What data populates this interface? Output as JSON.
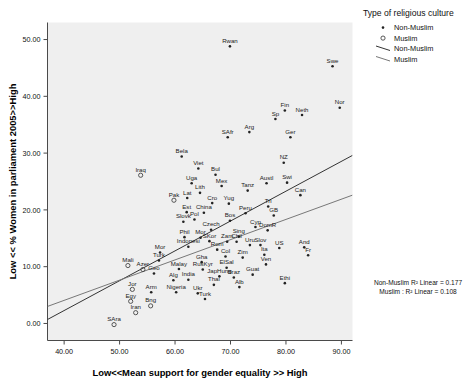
{
  "chart_data": {
    "type": "scatter",
    "title": "",
    "xlabel": "Low<<Mean support for gender equality >> High",
    "ylabel": "Low << % Women in parliament 2005>>High",
    "xlim": [
      37,
      92
    ],
    "ylim": [
      -3,
      53
    ],
    "xticks": [
      "40.00",
      "50.00",
      "60.00",
      "70.00",
      "80.00",
      "90.00"
    ],
    "xtick_values": [
      40,
      50,
      60,
      70,
      80,
      90
    ],
    "yticks": [
      "0.00",
      "10.00",
      "20.00",
      "30.00",
      "40.00",
      "50.00"
    ],
    "ytick_values": [
      0,
      10,
      20,
      30,
      40,
      50
    ],
    "grid": false,
    "legend_position": "right-top",
    "legend": {
      "title": "Type of religious culture",
      "entries": [
        {
          "label": "Non-Muslim",
          "marker": "filled-dot"
        },
        {
          "label": "Muslim",
          "marker": "open-circle"
        },
        {
          "label": "Non-Muslim",
          "marker": "line"
        },
        {
          "label": "Muslim",
          "marker": "line"
        }
      ]
    },
    "annotations": [
      "Non-Muslim R² Linear = 0.177",
      "Muslim : R² Linear = 0.108"
    ],
    "fit_lines": [
      {
        "name": "Non-Muslim",
        "x": [
          37.0,
          92.0
        ],
        "y": [
          0.7,
          29.6
        ],
        "color": "#333333"
      },
      {
        "name": "Muslim",
        "x": [
          37.0,
          92.0
        ],
        "y": [
          3.0,
          22.6
        ],
        "color": "#777777"
      }
    ],
    "series": [
      {
        "name": "Non-Muslim",
        "marker": "filled-dot",
        "points": [
          {
            "label": "Rwan",
            "x": 69.9,
            "y": 48.8
          },
          {
            "label": "Swe",
            "x": 88.4,
            "y": 45.3
          },
          {
            "label": "Nor",
            "x": 89.7,
            "y": 38.0
          },
          {
            "label": "Fin",
            "x": 79.8,
            "y": 37.5
          },
          {
            "label": "Neth",
            "x": 82.9,
            "y": 36.7
          },
          {
            "label": "Sp",
            "x": 78.1,
            "y": 36.0
          },
          {
            "label": "Ger",
            "x": 80.8,
            "y": 32.8
          },
          {
            "label": "Arg",
            "x": 73.4,
            "y": 33.7
          },
          {
            "label": "SAfr",
            "x": 69.5,
            "y": 32.8
          },
          {
            "label": "Bela",
            "x": 61.2,
            "y": 29.4
          },
          {
            "label": "NZ",
            "x": 79.6,
            "y": 28.3
          },
          {
            "label": "Viet",
            "x": 64.2,
            "y": 27.3
          },
          {
            "label": "Bul",
            "x": 67.3,
            "y": 26.2
          },
          {
            "label": "Austl",
            "x": 76.5,
            "y": 24.7
          },
          {
            "label": "Swi",
            "x": 80.2,
            "y": 24.8
          },
          {
            "label": "Uga",
            "x": 63.0,
            "y": 24.7
          },
          {
            "label": "Mex",
            "x": 68.4,
            "y": 24.2
          },
          {
            "label": "Tanz",
            "x": 73.1,
            "y": 23.4
          },
          {
            "label": "Can",
            "x": 82.6,
            "y": 22.6
          },
          {
            "label": "Lith",
            "x": 64.5,
            "y": 23.0
          },
          {
            "label": "Lat",
            "x": 62.2,
            "y": 22.1
          },
          {
            "label": "Cro",
            "x": 66.7,
            "y": 21.2
          },
          {
            "label": "Yug",
            "x": 69.7,
            "y": 21.1
          },
          {
            "label": "Tri",
            "x": 76.8,
            "y": 20.6
          },
          {
            "label": "Est",
            "x": 62.1,
            "y": 19.6
          },
          {
            "label": "China",
            "x": 65.2,
            "y": 19.5
          },
          {
            "label": "Peru",
            "x": 72.7,
            "y": 19.4
          },
          {
            "label": "GB",
            "x": 77.8,
            "y": 19.0
          },
          {
            "label": "Slovk",
            "x": 61.5,
            "y": 17.9
          },
          {
            "label": "Pol",
            "x": 63.5,
            "y": 18.3
          },
          {
            "label": "Bos",
            "x": 69.9,
            "y": 18.1
          },
          {
            "label": "Cyp",
            "x": 74.5,
            "y": 17.0
          },
          {
            "label": "DomR",
            "x": 76.7,
            "y": 16.4
          },
          {
            "label": "Czech",
            "x": 66.5,
            "y": 16.5
          },
          {
            "label": "Sing",
            "x": 71.5,
            "y": 15.3
          },
          {
            "label": "SKor",
            "x": 66.2,
            "y": 14.5
          },
          {
            "label": "Phil",
            "x": 61.7,
            "y": 15.2
          },
          {
            "label": "Mor",
            "x": 64.6,
            "y": 15.1
          },
          {
            "label": "Zam",
            "x": 69.4,
            "y": 14.4
          },
          {
            "label": "Chil",
            "x": 71.1,
            "y": 14.4
          },
          {
            "label": "Uru",
            "x": 73.5,
            "y": 13.8
          },
          {
            "label": "Slov",
            "x": 75.4,
            "y": 13.8
          },
          {
            "label": "US",
            "x": 78.8,
            "y": 13.3
          },
          {
            "label": "And",
            "x": 83.3,
            "y": 13.4
          },
          {
            "label": "Indonesi",
            "x": 62.4,
            "y": 13.5
          },
          {
            "label": "Rom",
            "x": 67.6,
            "y": 13.0
          },
          {
            "label": "Ita",
            "x": 76.1,
            "y": 12.1
          },
          {
            "label": "Fr",
            "x": 84.0,
            "y": 12.0
          },
          {
            "label": "Col",
            "x": 69.1,
            "y": 11.8
          },
          {
            "label": "Zim",
            "x": 72.2,
            "y": 11.6
          },
          {
            "label": "Ven",
            "x": 76.4,
            "y": 10.4
          },
          {
            "label": "Gha",
            "x": 64.8,
            "y": 10.8
          },
          {
            "label": "Mor2",
            "x": 57.3,
            "y": 12.5
          },
          {
            "label": "Turk",
            "x": 57.1,
            "y": 11.1
          },
          {
            "label": "Malay",
            "x": 60.7,
            "y": 9.6
          },
          {
            "label": "RusKyr",
            "x": 65.0,
            "y": 9.5
          },
          {
            "label": "ElSal",
            "x": 69.3,
            "y": 9.8
          },
          {
            "label": "Guat",
            "x": 74.0,
            "y": 8.6
          },
          {
            "label": "Braz",
            "x": 70.6,
            "y": 8.1
          },
          {
            "label": "JapHung",
            "x": 68.0,
            "y": 8.3
          },
          {
            "label": "India",
            "x": 62.4,
            "y": 7.7
          },
          {
            "label": "Alg",
            "x": 59.7,
            "y": 7.6
          },
          {
            "label": "Thai",
            "x": 67.0,
            "y": 6.8
          },
          {
            "label": "Alb",
            "x": 71.6,
            "y": 6.4
          },
          {
            "label": "Ethi",
            "x": 79.8,
            "y": 7.1
          },
          {
            "label": "Nigeria",
            "x": 60.2,
            "y": 5.5
          },
          {
            "label": "Ukr",
            "x": 64.1,
            "y": 5.3
          },
          {
            "label": "Turk2",
            "x": 65.4,
            "y": 4.3
          },
          {
            "label": "Arm",
            "x": 55.7,
            "y": 5.5
          },
          {
            "label": "Geo",
            "x": 56.2,
            "y": 8.8
          }
        ]
      },
      {
        "name": "Muslim",
        "marker": "open-circle",
        "points": [
          {
            "label": "Iraq",
            "x": 53.8,
            "y": 26.1
          },
          {
            "label": "Pak",
            "x": 59.8,
            "y": 21.7
          },
          {
            "label": "Mali",
            "x": 51.5,
            "y": 10.2
          },
          {
            "label": "Azer",
            "x": 54.2,
            "y": 9.5
          },
          {
            "label": "Jor",
            "x": 52.3,
            "y": 6.0
          },
          {
            "label": "Egy",
            "x": 52.0,
            "y": 3.9
          },
          {
            "label": "Bng",
            "x": 55.6,
            "y": 3.1
          },
          {
            "label": "Iran",
            "x": 52.9,
            "y": 1.9
          },
          {
            "label": "SAra",
            "x": 49.0,
            "y": -0.2
          }
        ]
      }
    ]
  }
}
